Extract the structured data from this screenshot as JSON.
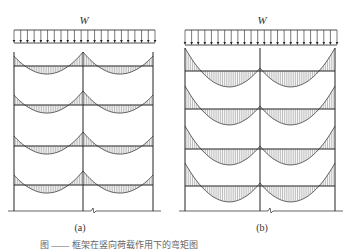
{
  "figure": {
    "panels": [
      {
        "id": "a",
        "label": "(a)",
        "load_label": "W",
        "columns_x": [
          14,
          83,
          153
        ],
        "top_y": 52,
        "beams_y": [
          66,
          105,
          146,
          185
        ],
        "ground_y": 211,
        "load_bar": {
          "x1": 14,
          "x2": 155,
          "y_top": 30,
          "y_bottom": 43,
          "arrows": 22
        },
        "moment_shape": "support-peaks",
        "hog_left": 10,
        "hog_mid": 14,
        "hog_right": 10,
        "sag": 8,
        "label_pos": {
          "x": 80,
          "y": 228
        }
      },
      {
        "id": "b",
        "label": "(b)",
        "load_label": "W",
        "columns_x": [
          185,
          260,
          335
        ],
        "top_y": 48,
        "beams_y": [
          71,
          109,
          149,
          186
        ],
        "ground_y": 211,
        "load_bar": {
          "x1": 185,
          "x2": 337,
          "y_top": 30,
          "y_bottom": 45,
          "arrows": 24
        },
        "moment_shape": "midspan-sag",
        "hog_left": 23,
        "hog_mid": 3,
        "hog_right": 23,
        "sag": 15,
        "label_pos": {
          "x": 262,
          "y": 228
        }
      }
    ],
    "caption": "图 —— 框架在竖向荷载作用下的弯矩图"
  }
}
